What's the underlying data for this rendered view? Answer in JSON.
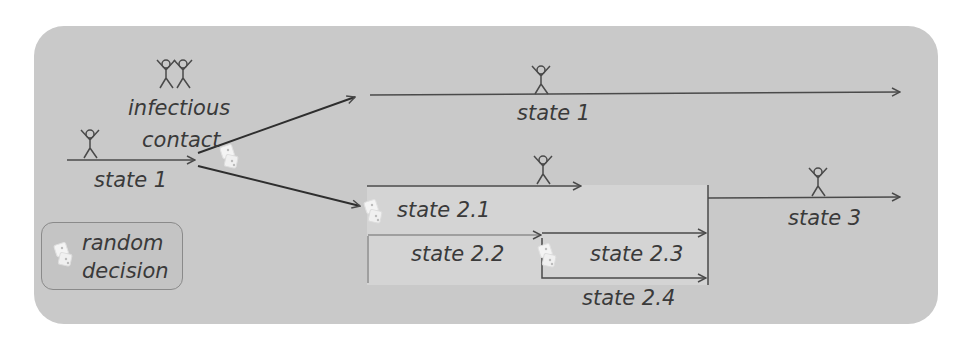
{
  "diagram": {
    "colors": {
      "panel": "#c9c9c9",
      "line": "#4a4a4a",
      "text": "#3a3a3a",
      "box": "#d6d6d6"
    },
    "labels": {
      "infectious_contact_line1": "infectious",
      "infectious_contact_line2": "contact",
      "start_state": "state 1",
      "branch_upper_state": "state 1",
      "state_2_1": "state 2.1",
      "state_2_2": "state 2.2",
      "state_2_3": "state 2.3",
      "state_2_4": "state 2.4",
      "state_3": "state 3"
    },
    "legend": {
      "icon": "dice-icon",
      "line1": "random",
      "line2": "decision"
    },
    "icons": [
      "person-icon",
      "two-persons-icon",
      "dice-icon"
    ]
  }
}
